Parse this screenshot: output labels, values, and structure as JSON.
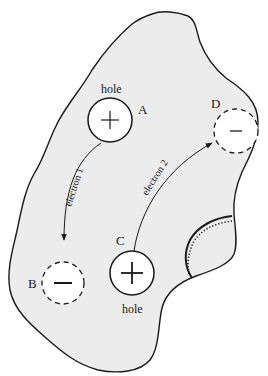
{
  "diagram": {
    "colors": {
      "region_fill": "#ececec",
      "outline": "#1a1a1a",
      "background": "#ffffff",
      "circle_fill": "#ffffff"
    },
    "sites": [
      {
        "id": "A",
        "letter": "A",
        "type": "hole",
        "charge_symbol": "+",
        "caption": "hole",
        "border": "solid"
      },
      {
        "id": "B",
        "letter": "B",
        "type": "electron-site",
        "charge_symbol": "−",
        "caption": "",
        "border": "dashed"
      },
      {
        "id": "C",
        "letter": "C",
        "type": "hole",
        "charge_symbol": "+",
        "caption": "hole",
        "border": "solid"
      },
      {
        "id": "D",
        "letter": "D",
        "type": "electron-site",
        "charge_symbol": "−",
        "caption": "",
        "border": "dashed"
      }
    ],
    "arrows": [
      {
        "label": "electron 1",
        "from": "A",
        "to": "B"
      },
      {
        "label": "electron 2",
        "from": "C",
        "to": "D"
      }
    ],
    "labels": {
      "hole_a": "hole",
      "hole_c": "hole",
      "letter_a": "A",
      "letter_b": "B",
      "letter_c": "C",
      "letter_d": "D",
      "electron1": "electron 1",
      "electron2": "electron 2"
    },
    "boundary_feature": {
      "description": "solid arc with parallel dotted arc at right edge of region"
    }
  }
}
